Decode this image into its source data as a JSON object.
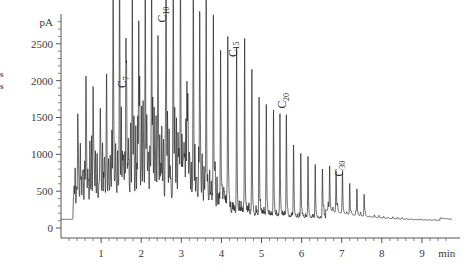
{
  "chart_data": {
    "type": "line",
    "title": "",
    "subtitle": "",
    "xlabel": "min",
    "ylabel": "pA",
    "xlim": [
      0,
      9.75
    ],
    "ylim": [
      0,
      2850
    ],
    "grid": false,
    "legend": "none",
    "x_ticks": [
      "1",
      "2",
      "3",
      "4",
      "5",
      "6",
      "7",
      "8",
      "9"
    ],
    "x_tick_values": [
      1,
      2,
      3,
      4,
      5,
      6,
      7,
      8,
      9
    ],
    "x_minor_per_interval": 5,
    "y_ticks": [
      "0",
      "500",
      "1000",
      "1500",
      "2000",
      "2500"
    ],
    "y_tick_values": [
      0,
      500,
      1000,
      1500,
      2000,
      2500
    ],
    "y_minor_per_interval": 5,
    "annotations": [
      {
        "text": "C7",
        "base": "C",
        "sub": "7",
        "x": 1.62,
        "y": 1900,
        "rotation": -90
      },
      {
        "text": "C10",
        "base": "C",
        "sub": "10",
        "x": 2.62,
        "y": 2790,
        "rotation": -90
      },
      {
        "text": "C15",
        "base": "C",
        "sub": "15",
        "x": 4.38,
        "y": 2320,
        "rotation": -90
      },
      {
        "text": "C20",
        "base": "C",
        "sub": "20",
        "x": 5.62,
        "y": 1620,
        "rotation": -90
      },
      {
        "text": "C30",
        "base": "C",
        "sub": "30",
        "x": 7.02,
        "y": 700,
        "rotation": -90
      }
    ],
    "series": [
      {
        "name": "FID signal",
        "color": "#1a1a1a",
        "alkane_peaks": [
          {
            "x": 1.62,
            "height": 1780,
            "label": "C7"
          },
          {
            "x": 2.62,
            "height": 2700,
            "label": "C10"
          },
          {
            "x": 4.38,
            "height": 2130,
            "label": "C15"
          },
          {
            "x": 5.62,
            "height": 1400,
            "label": "C20"
          },
          {
            "x": 7.02,
            "height": 520,
            "label": "C30"
          }
        ],
        "major_peaks_x": [
          0.42,
          0.62,
          0.8,
          0.98,
          1.14,
          1.3,
          1.46,
          1.62,
          1.78,
          1.94,
          2.1,
          2.26,
          2.42,
          2.62,
          2.8,
          2.98,
          3.14,
          3.3,
          3.46,
          3.62,
          3.8,
          3.98,
          4.16,
          4.38,
          4.58,
          4.76,
          4.94,
          5.12,
          5.3,
          5.46,
          5.62,
          5.8,
          5.98,
          6.16,
          6.34,
          6.52,
          6.7,
          6.86,
          7.02,
          7.2,
          7.38,
          7.56
        ],
        "major_peaks_y": [
          980,
          1480,
          1460,
          1150,
          1020,
          1880,
          2460,
          1780,
          1960,
          2440,
          2480,
          2740,
          1540,
          2700,
          2790,
          2470,
          1620,
          2600,
          2580,
          2250,
          2340,
          2120,
          2200,
          2130,
          2300,
          1980,
          1640,
          1520,
          1430,
          1360,
          1400,
          980,
          880,
          790,
          720,
          660,
          610,
          560,
          520,
          430,
          360,
          300
        ],
        "baseline_start": 120,
        "baseline_end": 120,
        "tail_level": 150
      }
    ]
  },
  "axes": {
    "y_unit": "pA",
    "x_unit": "min"
  },
  "margin_fragments": {
    "line1": "s",
    "line2": "s"
  }
}
